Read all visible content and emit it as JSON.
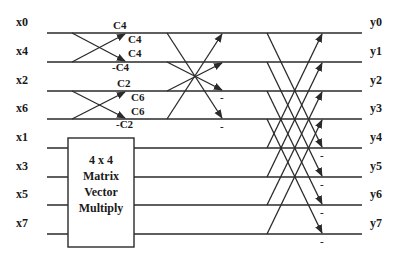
{
  "inputs": [
    "x0",
    "x4",
    "x2",
    "x6",
    "x1",
    "x3",
    "x5",
    "x7"
  ],
  "outputs": [
    "y0",
    "y1",
    "y2",
    "y3",
    "y4",
    "y5",
    "y6",
    "y7"
  ],
  "row_y": [
    33,
    62,
    91,
    119,
    148,
    177,
    205,
    234
  ],
  "block": {
    "lines": [
      "4 x 4",
      "Matrix",
      "Vector",
      "Multiply"
    ]
  },
  "stage1": {
    "pairs": [
      {
        "rows": [
          0,
          1
        ],
        "coefficients": {
          "top_in_top": "C4",
          "top_in_from_bottom": "C4",
          "bottom_in_from_top": "C4",
          "bottom_in_bottom": "-C4"
        }
      },
      {
        "rows": [
          2,
          3
        ],
        "coefficients": {
          "top_in_top": "C2",
          "top_in_from_bottom": "C6",
          "bottom_in_from_top": "C6",
          "bottom_in_bottom": "-C2"
        }
      }
    ]
  },
  "stage2": {
    "minus_rows": [
      2,
      3
    ],
    "minus_label": "-"
  },
  "stage3": {
    "minus_rows": [
      4,
      5,
      6,
      7
    ],
    "minus_label": "-"
  },
  "colors": {
    "ink": "#2a2a2a",
    "background": "#ffffff"
  }
}
